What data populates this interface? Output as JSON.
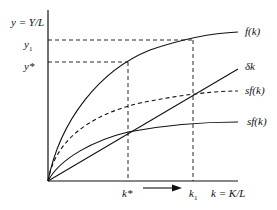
{
  "diagram": {
    "y_axis_label": "y = Y/L",
    "x_axis_label": "k = K/L",
    "y_ticks": [
      "y1",
      "y*"
    ],
    "y_tick_labels": {
      "y1": "y",
      "y1_sub": "1",
      "ystar": "y*"
    },
    "x_tick_labels": {
      "kstar": "k*",
      "k1": "k",
      "k1_sub": "1"
    },
    "curves": [
      {
        "name": "f(k)",
        "label": "f(k)",
        "style": "solid"
      },
      {
        "name": "delta-k",
        "label": "δk",
        "style": "solid"
      },
      {
        "name": "sf(k)-new",
        "label": "sf(k)",
        "style": "dashed"
      },
      {
        "name": "sf(k)-old",
        "label": "sf(k)",
        "style": "solid"
      }
    ],
    "arrow": {
      "from": "k*",
      "to": "k1",
      "direction": "right"
    },
    "colors": {
      "line": "#111111",
      "background": "#ffffff"
    }
  }
}
